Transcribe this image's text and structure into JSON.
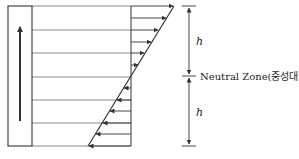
{
  "diagram": {
    "type": "stress-distribution",
    "labels": {
      "upper_dimension": "h",
      "lower_dimension": "h",
      "neutral_zone": "Neutral Zone(중성대)"
    },
    "geometry": {
      "bar": {
        "x": 8,
        "y": 6,
        "width": 24,
        "height": 140
      },
      "bar_arrow": {
        "x": 20,
        "y_start": 121,
        "y_end": 27,
        "direction": "up"
      },
      "horizontal_lines_y": [
        6,
        30,
        53,
        77,
        100,
        123,
        146
      ],
      "reference_line_x": 131,
      "diagonal": {
        "x1": 174,
        "y1": 6,
        "x2": 88,
        "y2": 146
      },
      "neutral_y": 76,
      "dimension_x": 189
    },
    "arrows": {
      "upper": [
        {
          "y": 6,
          "direction": "right"
        },
        {
          "y": 18,
          "direction": "right"
        },
        {
          "y": 30,
          "direction": "right"
        },
        {
          "y": 42,
          "direction": "right"
        },
        {
          "y": 53,
          "direction": "right"
        },
        {
          "y": 65,
          "direction": "right"
        }
      ],
      "lower": [
        {
          "y": 88,
          "direction": "left"
        },
        {
          "y": 100,
          "direction": "left"
        },
        {
          "y": 111,
          "direction": "left"
        },
        {
          "y": 123,
          "direction": "left"
        },
        {
          "y": 134,
          "direction": "left"
        },
        {
          "y": 146,
          "direction": "left"
        }
      ]
    },
    "colors": {
      "stroke": "#333333",
      "bar_stroke": "#444444",
      "line": "#888888"
    }
  }
}
